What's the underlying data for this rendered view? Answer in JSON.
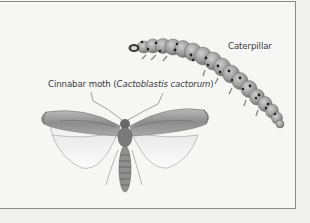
{
  "figure": {
    "labels": {
      "caterpillar": "Caterpillar",
      "moth_common": "Cinnabar moth (",
      "moth_scientific": "Cactoblastis cactorum",
      "moth_close": ")"
    },
    "subjects": [
      "caterpillar-illustration",
      "moth-illustration"
    ]
  }
}
